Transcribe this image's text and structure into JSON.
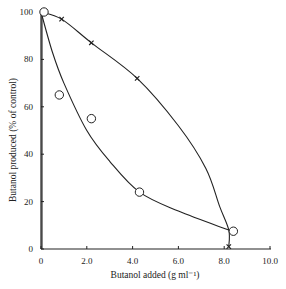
{
  "chart_data": {
    "type": "scatter",
    "title": "",
    "xlabel": "Butanol added (g ml⁻¹)",
    "ylabel": "Butanol produced (% of control)",
    "xlim": [
      0,
      10
    ],
    "ylim": [
      0,
      100
    ],
    "grid": false,
    "legend": null,
    "x_ticks": [
      0,
      2,
      4,
      6,
      8,
      10
    ],
    "x_tick_labels": [
      "0",
      "2.0",
      "4.0",
      "6.0",
      "8.0",
      "10.0"
    ],
    "y_ticks": [
      0,
      20,
      40,
      60,
      80,
      100
    ],
    "y_tick_labels": [
      "0",
      "20",
      "40",
      "60",
      "80",
      "100"
    ],
    "series": [
      {
        "name": "circles",
        "marker": "open-circle",
        "points": [
          [
            0,
            100
          ],
          [
            0.8,
            65
          ],
          [
            2.2,
            55
          ],
          [
            4.3,
            24
          ],
          [
            8.4,
            7.5
          ]
        ],
        "fit_curve": [
          [
            0,
            100
          ],
          [
            0.5,
            83
          ],
          [
            1.0,
            70
          ],
          [
            2.0,
            50
          ],
          [
            3.0,
            37
          ],
          [
            4.3,
            24
          ],
          [
            6.0,
            16
          ],
          [
            8.2,
            8
          ]
        ]
      },
      {
        "name": "crosses",
        "marker": "x",
        "points": [
          [
            0,
            100
          ],
          [
            0.9,
            97
          ],
          [
            2.2,
            87
          ],
          [
            4.2,
            72
          ],
          [
            8.2,
            1
          ]
        ],
        "fit_curve": [
          [
            0,
            100
          ],
          [
            0.9,
            97
          ],
          [
            2.2,
            87
          ],
          [
            4.2,
            72
          ],
          [
            6.0,
            52
          ],
          [
            7.2,
            34
          ],
          [
            7.8,
            18
          ],
          [
            8.2,
            8
          ],
          [
            8.2,
            1
          ]
        ]
      }
    ],
    "extra_curve": {
      "name": "vertical drop at zero",
      "points": [
        [
          0,
          100
        ],
        [
          0,
          0
        ]
      ]
    }
  },
  "labels": {
    "x_axis_title": "Butanol added (g ml⁻¹)",
    "y_axis_title": "Butanol produced (% of control)"
  }
}
